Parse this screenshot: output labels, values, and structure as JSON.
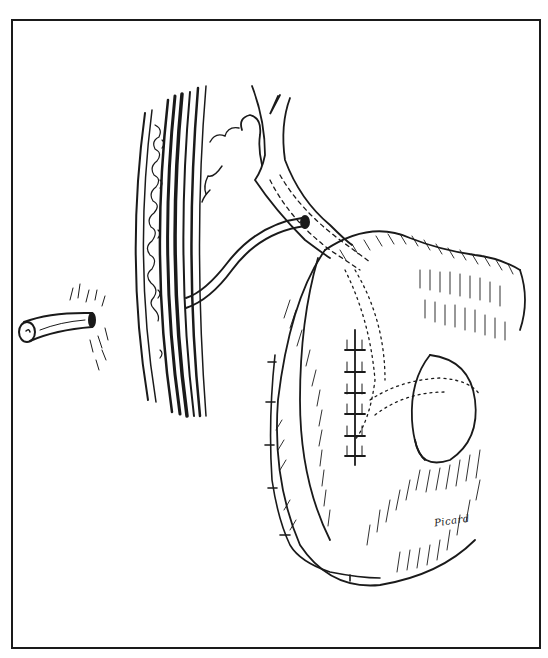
{
  "illustration": {
    "type": "surgical line drawing",
    "style": "pen-and-ink",
    "colors": {
      "ink": "#1a1a1a",
      "paper": "#ffffff"
    },
    "elements": [
      "external-drain-tube-end",
      "abdominal-wall-cross-section",
      "internal-drain-tube",
      "bile-duct-branching",
      "bowel-loop-with-suture-lines",
      "intestine-segment"
    ],
    "signature": "Picard"
  }
}
